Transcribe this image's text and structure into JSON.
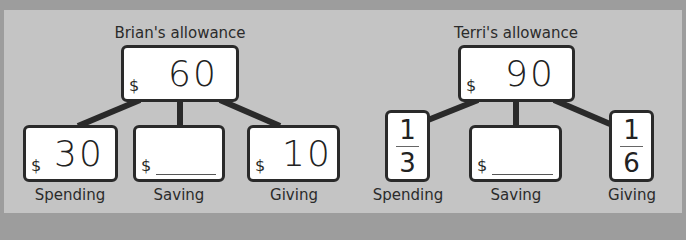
{
  "diagrams": [
    {
      "title": "Brian's allowance",
      "total": {
        "currency": "$",
        "value": "60"
      },
      "parts": [
        {
          "label": "Spending",
          "currency": "$",
          "value": "30"
        },
        {
          "label": "Saving",
          "currency": "$",
          "value": ""
        },
        {
          "label": "Giving",
          "currency": "$",
          "value": "10"
        }
      ]
    },
    {
      "title": "Terri's allowance",
      "total": {
        "currency": "$",
        "value": "90"
      },
      "parts": [
        {
          "label": "Spending",
          "fraction": {
            "numerator": "1",
            "denominator": "3"
          }
        },
        {
          "label": "Saving",
          "currency": "$",
          "value": ""
        },
        {
          "label": "Giving",
          "fraction": {
            "numerator": "1",
            "denominator": "6"
          }
        }
      ]
    }
  ],
  "colors": {
    "background": "#9d9d9d",
    "panel": "#c4c4c4",
    "box_border": "#2a2a2a",
    "box_fill": "#ffffff"
  }
}
